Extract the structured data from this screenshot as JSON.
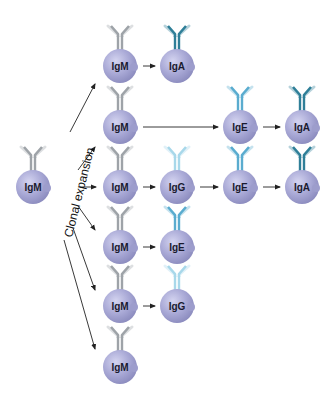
{
  "title_label": "Clonal expansion",
  "colors": {
    "cell_fill": "#a9a9d6",
    "cell_highlight": "#cfcfee",
    "cell_shadow": "#8888bb",
    "IgM": "#9ea3a8",
    "IgG": "#a8d8ea",
    "IgE": "#5aaccf",
    "IgA": "#2f7f98",
    "arrow": "#222222"
  },
  "source_cell": {
    "label": "IgM",
    "x": 33,
    "y": 187
  },
  "cells": [
    {
      "id": "r1c1",
      "label": "IgM",
      "x": 120,
      "y": 66
    },
    {
      "id": "r1c2",
      "label": "IgA",
      "x": 177,
      "y": 66
    },
    {
      "id": "r2c1",
      "label": "IgM",
      "x": 120,
      "y": 127
    },
    {
      "id": "r2c3",
      "label": "IgE",
      "x": 240,
      "y": 127
    },
    {
      "id": "r2c4",
      "label": "IgA",
      "x": 302,
      "y": 127
    },
    {
      "id": "r3c1",
      "label": "IgM",
      "x": 120,
      "y": 187
    },
    {
      "id": "r3c2",
      "label": "IgG",
      "x": 177,
      "y": 187
    },
    {
      "id": "r3c3",
      "label": "IgE",
      "x": 240,
      "y": 187
    },
    {
      "id": "r3c4",
      "label": "IgA",
      "x": 302,
      "y": 187
    },
    {
      "id": "r4c1",
      "label": "IgM",
      "x": 120,
      "y": 247
    },
    {
      "id": "r4c2",
      "label": "IgE",
      "x": 177,
      "y": 247
    },
    {
      "id": "r5c1",
      "label": "IgM",
      "x": 120,
      "y": 306
    },
    {
      "id": "r5c2",
      "label": "IgG",
      "x": 177,
      "y": 306
    },
    {
      "id": "r6c1",
      "label": "IgM",
      "x": 120,
      "y": 367
    }
  ],
  "switch_arrows": [
    {
      "from": "r1c1",
      "to": "r1c2"
    },
    {
      "from": "r2c1",
      "to": "r2c3"
    },
    {
      "from": "r2c3",
      "to": "r2c4"
    },
    {
      "from": "r3c1",
      "to": "r3c2"
    },
    {
      "from": "r3c2",
      "to": "r3c3"
    },
    {
      "from": "r3c3",
      "to": "r3c4"
    },
    {
      "from": "r4c1",
      "to": "r4c2"
    },
    {
      "from": "r5c1",
      "to": "r5c2"
    }
  ],
  "expansion_arrows": [
    {
      "x1": 70,
      "y1": 132,
      "x2": 95,
      "y2": 84
    },
    {
      "x1": 78,
      "y1": 170,
      "x2": 95,
      "y2": 147
    },
    {
      "x1": 80,
      "y1": 187,
      "x2": 96,
      "y2": 187
    },
    {
      "x1": 78,
      "y1": 206,
      "x2": 95,
      "y2": 230
    },
    {
      "x1": 73,
      "y1": 228,
      "x2": 95,
      "y2": 290
    },
    {
      "x1": 64,
      "y1": 240,
      "x2": 95,
      "y2": 349
    }
  ]
}
